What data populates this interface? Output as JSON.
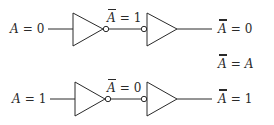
{
  "diagram": {
    "stroke_color": "#2a2a2a",
    "rows": [
      {
        "input_label": {
          "var": "A",
          "eq": "=",
          "value": "0"
        },
        "middle_label": {
          "var": "A",
          "overbar": "single",
          "eq": "=",
          "value": "1"
        },
        "output_label": {
          "var": "A",
          "overbar": "double",
          "eq": "=",
          "value": "0"
        }
      },
      {
        "input_label": {
          "var": "A",
          "eq": "=",
          "value": "1"
        },
        "middle_label": {
          "var": "A",
          "overbar": "single",
          "eq": "=",
          "value": "0"
        },
        "output_label": {
          "var": "A",
          "overbar": "double",
          "eq": "=",
          "value": "1"
        }
      }
    ],
    "identity": {
      "lhs_var": "A",
      "lhs_overbar": "double",
      "eq": "=",
      "rhs_var": "A"
    },
    "gates": [
      {
        "type": "NOT",
        "bubble": "output"
      },
      {
        "type": "NOT",
        "bubble": "input"
      }
    ]
  }
}
